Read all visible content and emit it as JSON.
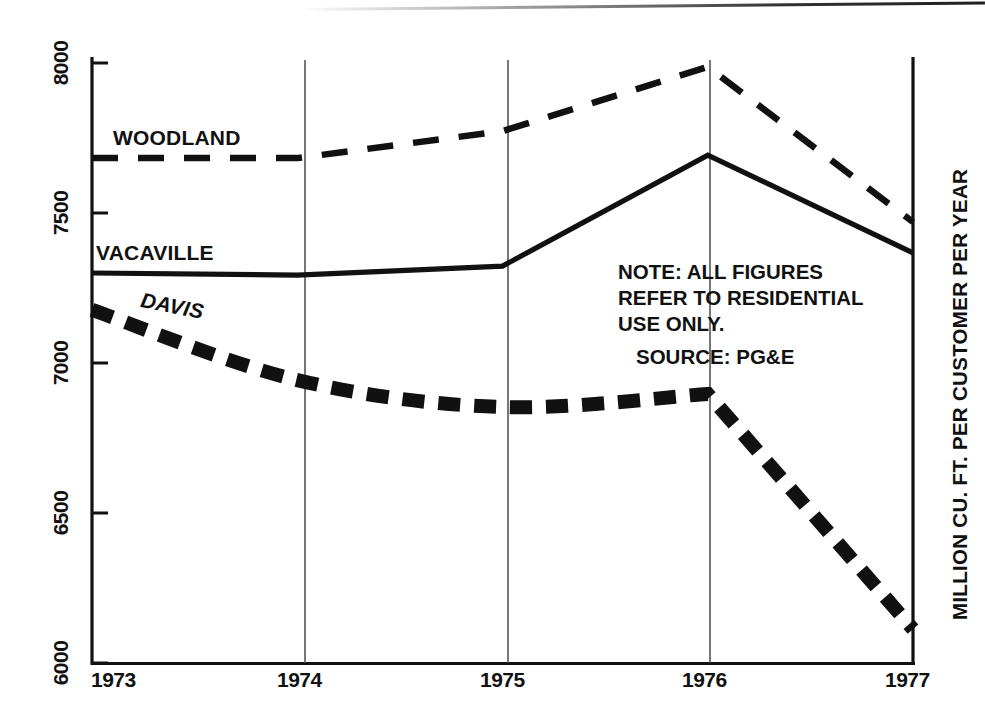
{
  "chart_data": {
    "type": "line",
    "title": "",
    "xlabel": "",
    "ylabel": "MILLION CU. FT. PER CUSTOMER PER YEAR",
    "x": [
      "1973",
      "1974",
      "1975",
      "1976",
      "1977"
    ],
    "xlim": [
      1973,
      1977
    ],
    "ylim": [
      6000,
      8000
    ],
    "yticks": [
      "6000",
      "6500",
      "7000",
      "7500",
      "8000"
    ],
    "grid": "vertical-only",
    "legend_position": "inline-labels",
    "series": [
      {
        "name": "WOODLAND",
        "style": "long-dashed",
        "values": [
          7683,
          7683,
          7773,
          7987,
          7470
        ]
      },
      {
        "name": "VACAVILLE",
        "style": "solid",
        "values": [
          7300,
          7293,
          7323,
          7693,
          7367
        ]
      },
      {
        "name": "DAVIS",
        "style": "thick-dashed",
        "values": [
          7177,
          6943,
          6853,
          6897,
          6113
        ]
      }
    ],
    "annotations": [
      "NOTE: ALL FIGURES",
      "REFER TO RESIDENTIAL",
      "USE ONLY.",
      "SOURCE: PG&E"
    ]
  },
  "axes": {
    "y_ticks": [
      {
        "label": "8000",
        "value": 8000
      },
      {
        "label": "7500",
        "value": 7500
      },
      {
        "label": "7000",
        "value": 7000
      },
      {
        "label": "6500",
        "value": 6500
      },
      {
        "label": "6000",
        "value": 6000
      }
    ],
    "x_ticks": [
      {
        "label": "1973"
      },
      {
        "label": "1974"
      },
      {
        "label": "1975"
      },
      {
        "label": "1976"
      },
      {
        "label": "1977"
      }
    ],
    "y_axis_title": "MILLION CU. FT. PER CUSTOMER PER YEAR"
  },
  "series_labels": {
    "woodland": "WOODLAND",
    "vacaville": "VACAVILLE",
    "davis": "DAVIS"
  },
  "note": {
    "line1": "NOTE: ALL FIGURES",
    "line2": "REFER TO RESIDENTIAL",
    "line3": "USE ONLY.",
    "source": "SOURCE: PG&E"
  },
  "colors": {
    "ink": "#111111",
    "background": "#ffffff",
    "gridline": "#4a4a4a"
  }
}
